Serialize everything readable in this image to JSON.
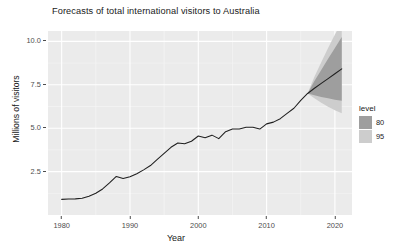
{
  "chart_data": {
    "type": "line",
    "title": "Forecasts of total international visitors to Australia",
    "xlabel": "Year",
    "ylabel": "Millions of visitors",
    "xlim": [
      1978.0,
      2022.5
    ],
    "ylim": [
      0.0,
      10.6
    ],
    "grid": true,
    "xticks": [
      "1980",
      "1990",
      "2000",
      "2010",
      "2020"
    ],
    "xtick_values": [
      1980,
      1990,
      2000,
      2010,
      2020
    ],
    "yticks": [
      "2.5",
      "5.0",
      "7.5",
      "10.0"
    ],
    "ytick_values": [
      2.5,
      5.0,
      7.5,
      10.0
    ],
    "legend": {
      "title": "level",
      "position": "right",
      "entries": [
        {
          "label": "80",
          "color": "#9e9e9e"
        },
        {
          "label": "95",
          "color": "#cdcdcd"
        }
      ]
    },
    "series": [
      {
        "name": "historical",
        "type": "line",
        "color": "#1f1f1f",
        "x": [
          1980,
          1981,
          1982,
          1983,
          1984,
          1985,
          1986,
          1987,
          1988,
          1989,
          1990,
          1991,
          1992,
          1993,
          1994,
          1995,
          1996,
          1997,
          1998,
          1999,
          2000,
          2001,
          2002,
          2003,
          2004,
          2005,
          2006,
          2007,
          2008,
          2009,
          2010,
          2011,
          2012,
          2013,
          2014,
          2015,
          2016
        ],
        "values": [
          0.9,
          0.92,
          0.93,
          0.96,
          1.08,
          1.25,
          1.5,
          1.85,
          2.22,
          2.1,
          2.2,
          2.38,
          2.6,
          2.85,
          3.2,
          3.55,
          3.9,
          4.15,
          4.1,
          4.25,
          4.55,
          4.45,
          4.6,
          4.4,
          4.8,
          4.95,
          4.95,
          5.05,
          5.05,
          4.95,
          5.25,
          5.35,
          5.55,
          5.85,
          6.15,
          6.6,
          7.0
        ]
      },
      {
        "name": "forecast-median",
        "type": "line",
        "color": "#1f1f1f",
        "x": [
          2016,
          2017,
          2018,
          2019,
          2020,
          2021
        ],
        "values": [
          7.0,
          7.3,
          7.58,
          7.86,
          8.14,
          8.42
        ]
      },
      {
        "name": "forecast-80",
        "type": "ribbon",
        "color": "#9e9e9e",
        "x": [
          2016,
          2017,
          2018,
          2019,
          2020,
          2021
        ],
        "lower": [
          7.0,
          6.9,
          6.8,
          6.72,
          6.64,
          6.58
        ],
        "upper": [
          7.0,
          7.72,
          8.36,
          9.0,
          9.62,
          10.25
        ]
      },
      {
        "name": "forecast-95",
        "type": "ribbon",
        "color": "#cdcdcd",
        "x": [
          2016,
          2017,
          2018,
          2019,
          2020,
          2021
        ],
        "lower": [
          7.0,
          6.72,
          6.46,
          6.24,
          6.04,
          5.86
        ],
        "upper": [
          7.0,
          7.96,
          8.8,
          9.62,
          10.4,
          11.1
        ]
      }
    ],
    "colors": {
      "panel_background": "#ebebeb",
      "grid_major": "#ffffff",
      "grid_minor": "#f5f5f5",
      "line": "#1f1f1f",
      "text": "#1a1a1a",
      "axis_text": "#4d4d4d"
    }
  }
}
